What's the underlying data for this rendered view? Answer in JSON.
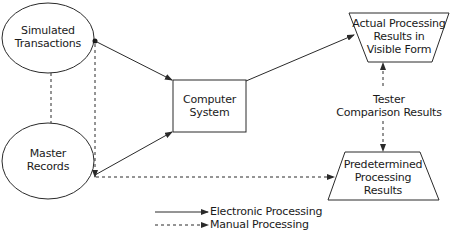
{
  "diagram": {
    "nodes": {
      "simulated_transactions": {
        "label_line1": "Simulated",
        "label_line2": "Transactions",
        "shape": "ellipse"
      },
      "master_records": {
        "label_line1": "Master",
        "label_line2": "Records",
        "shape": "ellipse"
      },
      "computer_system": {
        "label_line1": "Computer",
        "label_line2": "System",
        "shape": "rectangle"
      },
      "actual_results": {
        "label_line1": "Actual Processing",
        "label_line2": "Results in",
        "label_line3": "Visible Form",
        "shape": "inverted-trapezoid"
      },
      "predetermined_results": {
        "label_line1": "Predetermined",
        "label_line2": "Processing",
        "label_line3": "Results",
        "shape": "trapezoid"
      }
    },
    "comparison_label": {
      "line1": "Tester",
      "line2": "Comparison Results"
    },
    "edges": [
      {
        "from": "simulated_transactions",
        "to": "computer_system",
        "type": "electronic"
      },
      {
        "from": "master_records",
        "to": "computer_system",
        "type": "electronic"
      },
      {
        "from": "computer_system",
        "to": "actual_results",
        "type": "electronic"
      },
      {
        "from": "simulated_transactions",
        "to": "master_records",
        "type": "manual"
      },
      {
        "from": "master_records",
        "to": "predetermined_results",
        "type": "manual"
      },
      {
        "from": "actual_results",
        "to": "predetermined_results",
        "type": "manual-bidirectional"
      }
    ],
    "legend": {
      "electronic": "Electronic Processing",
      "manual": "Manual Processing"
    },
    "stroke_color": "#2a2a2a"
  }
}
